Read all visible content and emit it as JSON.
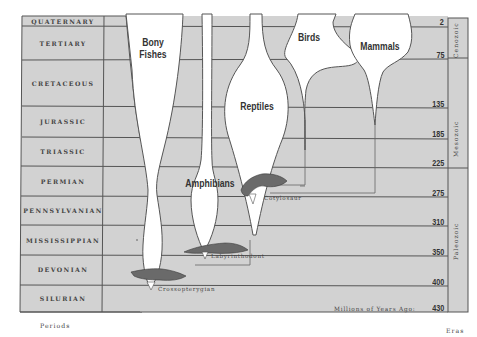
{
  "periods": [
    {
      "name": "QUATERNARY",
      "mya": "2"
    },
    {
      "name": "TERTIARY",
      "mya": "75"
    },
    {
      "name": "CRETACEOUS",
      "mya": "135"
    },
    {
      "name": "JURASSIC",
      "mya": "185"
    },
    {
      "name": "TRIASSIC",
      "mya": "225"
    },
    {
      "name": "PERMIAN",
      "mya": "275"
    },
    {
      "name": "PENNSYLVANIAN",
      "mya": "310"
    },
    {
      "name": "MISSISSIPPIAN",
      "mya": "350"
    },
    {
      "name": "DEVONIAN",
      "mya": "400"
    },
    {
      "name": "SILURIAN",
      "mya": "430"
    }
  ],
  "eras": [
    {
      "name": "Cenozoic",
      "from": "QUATERNARY",
      "to": "TERTIARY"
    },
    {
      "name": "Mesozoic",
      "from": "CRETACEOUS",
      "to": "TRIASSIC"
    },
    {
      "name": "Paleozoic",
      "from": "PERMIAN",
      "to": "SILURIAN"
    }
  ],
  "lineages": [
    {
      "name": "Bony Fishes",
      "line1": "Bony",
      "line2": "Fishes"
    },
    {
      "name": "Amphibians"
    },
    {
      "name": "Reptiles"
    },
    {
      "name": "Birds"
    },
    {
      "name": "Mammals"
    }
  ],
  "animals": [
    {
      "name": "Crossopterygian"
    },
    {
      "name": "Labyrinthodont"
    },
    {
      "name": "Cotylosaur"
    }
  ],
  "captions": {
    "mya_label": "Millions of Years Ago:",
    "periods_footer": "Periods",
    "eras_footer": "Eras"
  },
  "colors": {
    "band_fill": "#d2d2d2",
    "line": "#555555",
    "lineage_fill": "#ffffff",
    "animal_fill": "#6a6a6a"
  }
}
